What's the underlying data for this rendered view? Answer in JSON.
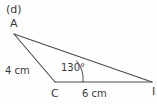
{
  "figure": {
    "part_label": "(d)",
    "shape": "triangle",
    "stroke_color": "#4a4a4a",
    "background_color": "#fefefe",
    "text_color": "#3a3a3a",
    "vertices": [
      {
        "name": "A",
        "label": "A",
        "x": 14,
        "y": 34
      },
      {
        "name": "C",
        "label": "C",
        "x": 55,
        "y": 82
      },
      {
        "name": "I",
        "label": "I",
        "x": 152,
        "y": 82
      }
    ],
    "sides": [
      {
        "name": "AC",
        "label": "4 cm",
        "length_value": 4,
        "unit": "cm"
      },
      {
        "name": "CI",
        "label": "6 cm",
        "length_value": 6,
        "unit": "cm"
      },
      {
        "name": "AI",
        "label": "",
        "length_value": null,
        "unit": ""
      }
    ],
    "angles": [
      {
        "at_vertex": "C",
        "label": "130°",
        "value": 130,
        "unit": "degrees",
        "marked": true
      }
    ]
  }
}
